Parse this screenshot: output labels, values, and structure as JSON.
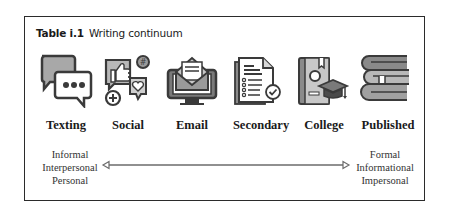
{
  "table": {
    "number": "Table i.1",
    "title": "Writing continuum"
  },
  "items": [
    {
      "label": "Texting",
      "icon": "chat-bubbles-icon"
    },
    {
      "label": "Social",
      "icon": "social-media-icon"
    },
    {
      "label": "Email",
      "icon": "email-monitor-icon"
    },
    {
      "label": "Secondary",
      "icon": "document-checklist-icon"
    },
    {
      "label": "College",
      "icon": "diploma-graduation-icon"
    },
    {
      "label": "Published",
      "icon": "book-stack-icon"
    }
  ],
  "continuum": {
    "left": [
      "Informal",
      "Interpersonal",
      "Personal"
    ],
    "right": [
      "Formal",
      "Informational",
      "Impersonal"
    ]
  },
  "colors": {
    "border": "#2b2b2b",
    "icon_dark": "#3a3a3a",
    "icon_mid": "#9a9a9a",
    "icon_light": "#d8d8d8",
    "arrow": "#6b6b6b"
  }
}
